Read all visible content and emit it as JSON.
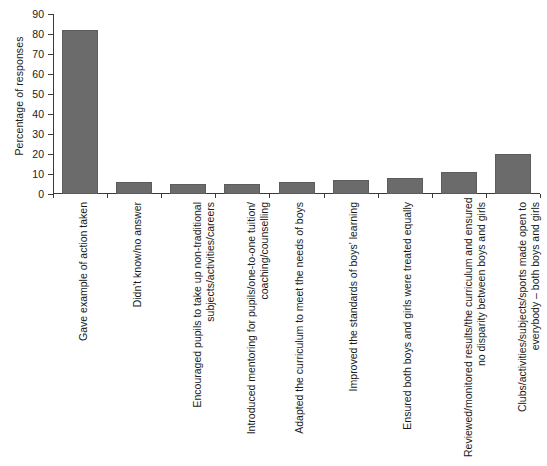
{
  "chart_data": {
    "type": "bar",
    "title": "",
    "xlabel": "",
    "ylabel": "Percentage of responses",
    "ylim": [
      0,
      90
    ],
    "ytick_labels": [
      "90",
      "80",
      "70",
      "60",
      "50",
      "40",
      "30",
      "20",
      "10",
      "0"
    ],
    "yticks": [
      90,
      80,
      70,
      60,
      50,
      40,
      30,
      20,
      10,
      0
    ],
    "grid": false,
    "legend": null,
    "orientation": "vertical",
    "bar_color": "#6b6b6b",
    "axis_color": "#3a3a3a",
    "categories": [
      "Gave example of action taken",
      "Didn't know/no answer",
      "Encouraged pupils to take up non-traditional subjects/activities/careers",
      "Introduced mentoring for pupils/one-to-one tuition/ coaching/counselling",
      "Adapted the curriculum to meet the needs of boys",
      "Improved the standards of boys' learning",
      "Ensured both boys and girls were treated equally",
      "Reviewed/monitored results/the curriculum and ensured no disparity between boys and girls",
      "Clubs/activities/subjects/sports made open to everybody – both boys and girls"
    ],
    "category_lines": [
      [
        "Gave example of action taken"
      ],
      [
        "Didn't know/no answer"
      ],
      [
        "Encouraged pupils to take up non-traditional",
        "subjects/activities/careers"
      ],
      [
        "Introduced mentoring for pupils/one-to-one tuition/",
        "coaching/counselling"
      ],
      [
        "Adapted the curriculum to meet the needs of boys"
      ],
      [
        "Improved the standards of boys' learning"
      ],
      [
        "Ensured both boys and girls were treated equally"
      ],
      [
        "Reviewed/monitored results/the curriculum and ensured",
        "no disparity between boys and girls"
      ],
      [
        "Clubs/activities/subjects/sports made open to",
        "everybody – both boys and girls"
      ]
    ],
    "values": [
      82,
      6,
      5,
      5,
      6,
      7,
      8,
      11,
      20
    ]
  }
}
